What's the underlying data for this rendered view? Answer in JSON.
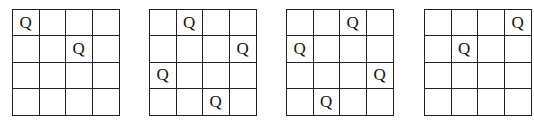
{
  "piece_symbol": "Q",
  "board_size": 4,
  "boards": [
    {
      "name": "board-1",
      "left": 12,
      "queens": [
        [
          0,
          0
        ],
        [
          1,
          2
        ]
      ]
    },
    {
      "name": "board-2",
      "left": 149,
      "queens": [
        [
          0,
          1
        ],
        [
          1,
          3
        ],
        [
          2,
          0
        ],
        [
          3,
          2
        ]
      ]
    },
    {
      "name": "board-3",
      "left": 286,
      "queens": [
        [
          0,
          2
        ],
        [
          1,
          0
        ],
        [
          2,
          3
        ],
        [
          3,
          1
        ]
      ]
    },
    {
      "name": "board-4",
      "left": 424,
      "queens": [
        [
          0,
          3
        ],
        [
          1,
          1
        ]
      ]
    }
  ]
}
